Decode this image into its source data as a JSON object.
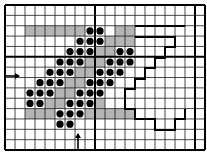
{
  "diagram": {
    "grid": {
      "origin_x": 5,
      "origin_y": 5,
      "cols": 20,
      "rows": 14,
      "cell_w": 10,
      "cell_h": 10.36,
      "thick_cols": [
        0,
        9,
        19,
        20
      ],
      "thick_rows": [
        0,
        5,
        14
      ],
      "line_color": "#1a1a1a",
      "border_color": "#000000"
    },
    "shaded_color": "#b5b5b5",
    "dot_color": "#000000",
    "path_color": "#000000",
    "shaded_cells": [
      [
        2,
        2
      ],
      [
        2,
        3
      ],
      [
        2,
        4
      ],
      [
        2,
        5
      ],
      [
        2,
        6
      ],
      [
        2,
        7
      ],
      [
        2,
        11
      ],
      [
        2,
        12
      ],
      [
        3,
        10
      ],
      [
        3,
        11
      ],
      [
        3,
        12
      ],
      [
        4,
        9
      ],
      [
        4,
        10
      ],
      [
        5,
        8
      ],
      [
        5,
        9
      ],
      [
        6,
        7
      ],
      [
        6,
        8
      ],
      [
        7,
        6
      ],
      [
        7,
        7
      ],
      [
        8,
        5
      ],
      [
        8,
        6
      ],
      [
        9,
        4
      ],
      [
        9,
        5
      ],
      [
        9,
        9
      ],
      [
        10,
        2
      ],
      [
        10,
        3
      ],
      [
        10,
        4
      ],
      [
        10,
        8
      ],
      [
        10,
        9
      ],
      [
        10,
        10
      ],
      [
        10,
        11
      ],
      [
        10,
        12
      ]
    ],
    "dots": [
      [
        2,
        8
      ],
      [
        2,
        9
      ],
      [
        3,
        7
      ],
      [
        3,
        8
      ],
      [
        3,
        9
      ],
      [
        4,
        6
      ],
      [
        4,
        7
      ],
      [
        4,
        8
      ],
      [
        4,
        11
      ],
      [
        4,
        12
      ],
      [
        5,
        5
      ],
      [
        5,
        6
      ],
      [
        5,
        7
      ],
      [
        5,
        10
      ],
      [
        5,
        11
      ],
      [
        5,
        12
      ],
      [
        6,
        4
      ],
      [
        6,
        5
      ],
      [
        6,
        6
      ],
      [
        6,
        9
      ],
      [
        6,
        10
      ],
      [
        6,
        11
      ],
      [
        7,
        3
      ],
      [
        7,
        4
      ],
      [
        7,
        5
      ],
      [
        7,
        8
      ],
      [
        7,
        9
      ],
      [
        7,
        10
      ],
      [
        8,
        2
      ],
      [
        8,
        3
      ],
      [
        8,
        4
      ],
      [
        8,
        7
      ],
      [
        8,
        8
      ],
      [
        8,
        9
      ],
      [
        9,
        2
      ],
      [
        9,
        3
      ],
      [
        9,
        6
      ],
      [
        9,
        7
      ],
      [
        9,
        8
      ],
      [
        10,
        5
      ],
      [
        10,
        6
      ],
      [
        10,
        7
      ],
      [
        11,
        5
      ],
      [
        11,
        6
      ]
    ],
    "top_line": [
      [
        135,
        26
      ],
      [
        185,
        26
      ]
    ],
    "staircase_path": [
      [
        135,
        37
      ],
      [
        175,
        37
      ],
      [
        175,
        47
      ],
      [
        165,
        47
      ],
      [
        165,
        58
      ],
      [
        155,
        58
      ],
      [
        155,
        68
      ],
      [
        145,
        68
      ],
      [
        145,
        79
      ],
      [
        135,
        79
      ],
      [
        135,
        89
      ],
      [
        125,
        89
      ],
      [
        125,
        109
      ],
      [
        135,
        109
      ],
      [
        135,
        119
      ],
      [
        155,
        119
      ],
      [
        155,
        130
      ],
      [
        175,
        130
      ],
      [
        175,
        119
      ],
      [
        185,
        119
      ],
      [
        185,
        109
      ]
    ],
    "arrows": [
      {
        "name": "left-entry-arrow",
        "direction": "right",
        "x1": 5,
        "y1": 76,
        "x2": 19,
        "y2": 76
      },
      {
        "name": "bottom-entry-arrow",
        "direction": "up",
        "x1": 78,
        "y1": 150,
        "x2": 78,
        "y2": 134
      }
    ]
  }
}
